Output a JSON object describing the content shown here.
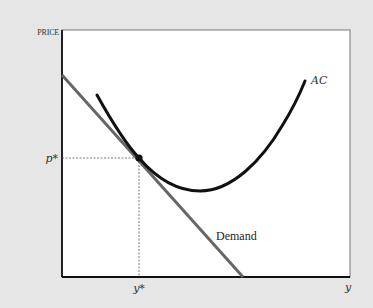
{
  "diagram": {
    "type": "economics-cost-demand",
    "y_axis_label": "PRICE",
    "x_axis_label": "y",
    "equilibrium_price_label": "p*",
    "equilibrium_quantity_label": "y*",
    "curves": [
      {
        "name": "AC",
        "label": "AC",
        "shape": "U-shaped",
        "color": "#111111"
      },
      {
        "name": "Demand",
        "label": "Demand",
        "shape": "downward-sloping line",
        "color": "#666666"
      }
    ],
    "tangency_point": {
      "label": "(y*, p*)",
      "marker": "filled dot"
    },
    "colors": {
      "background": "#e6e6e6",
      "plot": "#ffffff",
      "axes": "#111111"
    }
  }
}
